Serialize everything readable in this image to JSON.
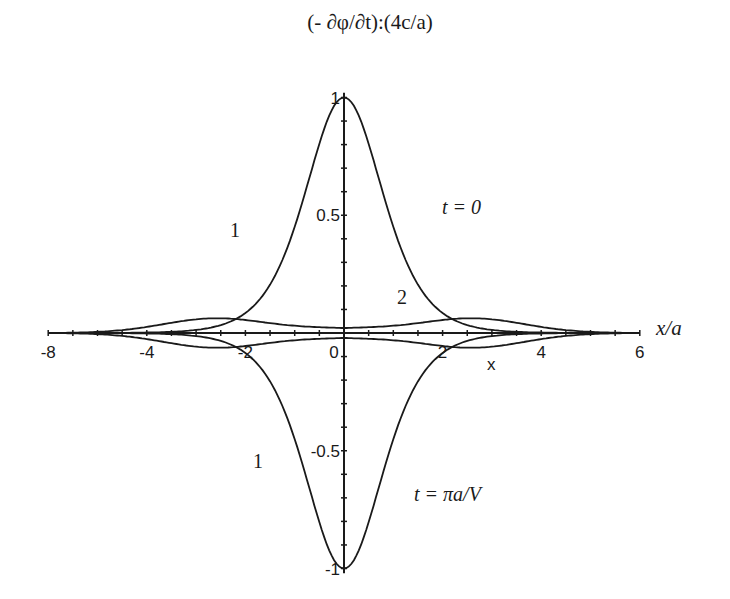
{
  "chart_data": {
    "type": "line",
    "title": "(- ∂φ/∂t):(4c/a)",
    "xlabel": "x/a",
    "ylabel": "",
    "xlim": [
      -6,
      6
    ],
    "ylim": [
      -1,
      1
    ],
    "grid": false,
    "x_tick_labels": [
      "-8",
      "-4",
      "-2",
      "0",
      "2",
      "4",
      "6"
    ],
    "x_ticks": [
      -6,
      -4,
      -2,
      0,
      2,
      4,
      6
    ],
    "y_tick_labels": [
      "1",
      "0.5",
      "-0.5",
      "-1"
    ],
    "y_ticks": [
      1,
      0.5,
      -0.5,
      -1
    ],
    "annotations": [
      {
        "text": "t = 0",
        "x": 2.0,
        "y": 0.5
      },
      {
        "text": "t = πa/V",
        "x": 2.0,
        "y": -0.66
      },
      {
        "text": "1",
        "x": -2.2,
        "y": 0.45
      },
      {
        "text": "1",
        "x": -2.2,
        "y": -0.55
      },
      {
        "text": "2",
        "x": 1.4,
        "y": 0.11
      },
      {
        "text": "x",
        "x": 3.0,
        "y": -0.14
      }
    ],
    "x": [
      -6,
      -5,
      -4,
      -3,
      -2,
      -1.5,
      -1,
      -0.5,
      0,
      0.5,
      1,
      1.5,
      2,
      3,
      4,
      5,
      6
    ],
    "series": [
      {
        "name": "1 (t = 0)",
        "values": [
          0.005,
          0.013,
          0.036,
          0.099,
          0.266,
          0.425,
          0.648,
          0.887,
          1.0,
          0.887,
          0.648,
          0.425,
          0.266,
          0.099,
          0.036,
          0.013,
          0.005
        ]
      },
      {
        "name": "1 (t = πa/V)",
        "values": [
          -0.005,
          -0.013,
          -0.036,
          -0.099,
          -0.266,
          -0.425,
          -0.648,
          -0.887,
          -1.0,
          -0.887,
          -0.648,
          -0.425,
          -0.266,
          -0.099,
          -0.036,
          -0.013,
          -0.005
        ]
      },
      {
        "name": "2 (t = 0)",
        "values": [
          0.004,
          0.015,
          0.04,
          0.06,
          0.058,
          0.048,
          0.035,
          0.022,
          0.02,
          0.022,
          0.035,
          0.048,
          0.058,
          0.06,
          0.04,
          0.015,
          0.004
        ]
      },
      {
        "name": "2 (t = πa/V)",
        "values": [
          -0.004,
          -0.015,
          -0.04,
          -0.06,
          -0.058,
          -0.048,
          -0.035,
          -0.022,
          -0.02,
          -0.022,
          -0.035,
          -0.048,
          -0.058,
          -0.06,
          -0.04,
          -0.015,
          -0.004
        ]
      }
    ]
  },
  "labels": {
    "title": "(- ∂φ/∂t):(4c/a)",
    "xlabel": "x/a",
    "t0": "t = 0",
    "tpi": "t = πa/V",
    "curve1_top": "1",
    "curve1_bottom": "1",
    "curve2": "2",
    "marker_x": "x",
    "xticks": [
      "-8",
      "-4",
      "-2",
      "0",
      "2",
      "4",
      "6"
    ],
    "yticks": [
      "1",
      "0.5",
      "-0.5",
      "-1"
    ]
  }
}
